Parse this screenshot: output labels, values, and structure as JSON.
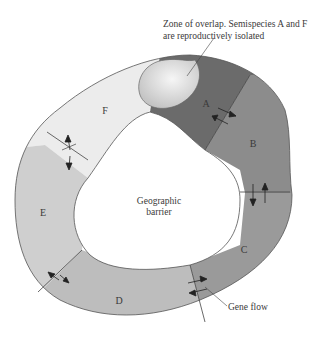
{
  "diagram": {
    "annotations": {
      "overlap_line1": "Zone of overlap. Semispecies A and F",
      "overlap_line2": "are reproductively isolated",
      "barrier_line1": "Geographic",
      "barrier_line2": "barrier",
      "gene_flow": "Gene flow"
    },
    "regions": [
      {
        "id": "A",
        "label": "A",
        "color": "#6b6b6b"
      },
      {
        "id": "B",
        "label": "B",
        "color": "#8c8c8c"
      },
      {
        "id": "C",
        "label": "C",
        "color": "#9a9a9a"
      },
      {
        "id": "D",
        "label": "D",
        "color": "#bdbdbd"
      },
      {
        "id": "E",
        "label": "E",
        "color": "#cfcfcf"
      },
      {
        "id": "F",
        "label": "F",
        "color": "#ececec"
      }
    ],
    "overlap_zone_color": "#d8d8d8",
    "gene_flow_arrows": [
      "A-B",
      "B-C",
      "C-D",
      "D-E",
      "E-F"
    ]
  }
}
